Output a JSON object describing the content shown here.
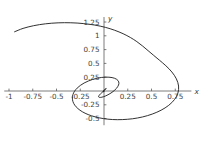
{
  "chart_data": {
    "type": "line",
    "title": "",
    "subtitle": "",
    "xlabel": "x",
    "ylabel": "y",
    "grid": false,
    "legend": false,
    "legend_position": "none",
    "xlim": [
      -1.05,
      0.92
    ],
    "ylim": [
      -0.62,
      1.34
    ],
    "x_ticks": [
      -1,
      -0.75,
      -0.5,
      -0.25,
      0.25,
      0.5,
      0.75
    ],
    "x_tick_labels": [
      "-1",
      "-0.75",
      "-0.5",
      "-0.25",
      "0.25",
      "0.5",
      "0.75"
    ],
    "y_ticks": [
      1.25,
      1,
      0.75,
      0.5,
      0.25,
      -0.25,
      -0.5
    ],
    "y_tick_labels": [
      "1.25",
      "1",
      "0.75",
      "0.5",
      "0.25",
      "-0.25",
      "-0.5"
    ],
    "axes_origin": [
      0,
      0
    ],
    "series": [
      {
        "name": "spiral",
        "color": "#1a1a1a",
        "description": "inward logarithmic spiral",
        "x": [
          -0.941,
          -0.852,
          -0.741,
          -0.616,
          -0.483,
          -0.349,
          -0.219,
          -0.097,
          0.014,
          0.113,
          0.201,
          0.278,
          0.346,
          0.407,
          0.464,
          0.523,
          0.585,
          0.651,
          0.714,
          0.762,
          0.785,
          0.778,
          0.742,
          0.681,
          0.601,
          0.508,
          0.406,
          0.3,
          0.193,
          0.09,
          -0.006,
          -0.092,
          -0.167,
          -0.228,
          -0.275,
          -0.308,
          -0.327,
          -0.333,
          -0.327,
          -0.31,
          -0.283,
          -0.249,
          -0.209,
          -0.165,
          -0.119,
          -0.073,
          -0.028,
          0.014,
          0.052,
          0.085,
          0.112,
          0.133,
          0.147,
          0.155,
          0.157,
          0.153,
          0.144,
          0.131,
          0.114,
          0.095,
          0.074,
          0.053,
          0.032,
          0.012,
          -0.006,
          -0.022,
          -0.035,
          -0.045,
          -0.052,
          -0.056,
          -0.057,
          -0.055,
          -0.051,
          -0.045,
          -0.037,
          -0.028,
          -0.019,
          -0.01,
          -0.001,
          0.006,
          0.013,
          0.018,
          0.021,
          0.023,
          0.024,
          0.023,
          0.021,
          0.018,
          0.015,
          0.011,
          0.007,
          0.004,
          0.001,
          -0.002,
          -0.004,
          -0.006,
          -0.007,
          -0.007,
          -0.007,
          -0.006,
          -0.005,
          -0.004,
          -0.002,
          -0.001,
          0.0,
          0.001,
          0.002,
          0.002
        ],
        "y": [
          1.073,
          1.134,
          1.183,
          1.217,
          1.235,
          1.236,
          1.222,
          1.194,
          1.153,
          1.1,
          1.038,
          0.969,
          0.894,
          0.814,
          0.731,
          0.645,
          0.556,
          0.458,
          0.345,
          0.22,
          0.09,
          -0.037,
          -0.155,
          -0.26,
          -0.348,
          -0.418,
          -0.47,
          -0.503,
          -0.518,
          -0.517,
          -0.5,
          -0.469,
          -0.427,
          -0.376,
          -0.318,
          -0.256,
          -0.192,
          -0.127,
          -0.064,
          -0.004,
          0.052,
          0.101,
          0.145,
          0.181,
          0.21,
          0.231,
          0.245,
          0.251,
          0.25,
          0.243,
          0.23,
          0.212,
          0.19,
          0.165,
          0.137,
          0.108,
          0.078,
          0.047,
          0.018,
          -0.01,
          -0.036,
          -0.058,
          -0.077,
          -0.093,
          -0.104,
          -0.112,
          -0.116,
          -0.117,
          -0.114,
          -0.109,
          -0.101,
          -0.091,
          -0.079,
          -0.066,
          -0.052,
          -0.038,
          -0.024,
          -0.01,
          0.003,
          0.014,
          0.024,
          0.032,
          0.038,
          0.043,
          0.045,
          0.046,
          0.045,
          0.042,
          0.039,
          0.034,
          0.029,
          0.023,
          0.017,
          0.011,
          0.005,
          0.0,
          -0.004,
          -0.008,
          -0.011,
          -0.013,
          -0.014,
          -0.015,
          -0.014,
          -0.013,
          -0.012,
          -0.01,
          -0.008,
          -0.006
        ]
      }
    ]
  }
}
